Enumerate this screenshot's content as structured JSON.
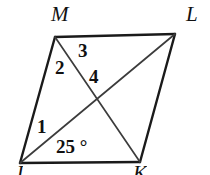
{
  "figure": {
    "type": "geometry-diagram",
    "shape": "parallelogram",
    "background_color": "#ffffff",
    "stroke_color": "#1a1a1a",
    "diagonal_color": "#4a4a4a",
    "vertices": [
      {
        "name": "M",
        "x": 55,
        "y": 37,
        "label": "M",
        "label_x": 51,
        "label_y": 4
      },
      {
        "name": "L",
        "x": 175,
        "y": 34,
        "label": "L",
        "label_x": 186,
        "label_y": 4
      },
      {
        "name": "K",
        "x": 140,
        "y": 162,
        "label": "K",
        "label_x": 133,
        "label_y": 163
      },
      {
        "name": "J",
        "x": 20,
        "y": 163,
        "label": "J",
        "label_x": 14,
        "label_y": 163
      }
    ],
    "intersection": {
      "x": 98,
      "y": 98
    },
    "sides": [
      {
        "from": "M",
        "to": "L"
      },
      {
        "from": "L",
        "to": "K"
      },
      {
        "from": "K",
        "to": "J"
      },
      {
        "from": "J",
        "to": "M"
      }
    ],
    "diagonals": [
      {
        "from": "M",
        "to": "K"
      },
      {
        "from": "J",
        "to": "L"
      }
    ],
    "angle_labels": [
      {
        "id": "angle-3",
        "text": "3",
        "x": 78,
        "y": 41
      },
      {
        "id": "angle-2",
        "text": "2",
        "x": 55,
        "y": 58
      },
      {
        "id": "angle-4",
        "text": "4",
        "x": 89,
        "y": 67
      },
      {
        "id": "angle-1",
        "text": "1",
        "x": 37,
        "y": 117
      },
      {
        "id": "angle-25",
        "text": "25 °",
        "x": 56,
        "y": 137
      }
    ]
  }
}
